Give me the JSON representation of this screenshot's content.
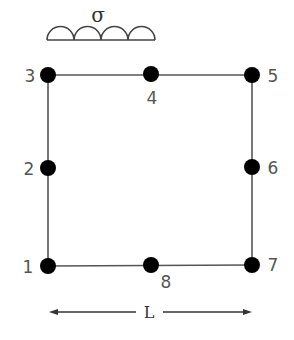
{
  "diagram": {
    "title": "",
    "load": {
      "symbol": "σ",
      "arcs": 4
    },
    "dimension": {
      "label": "L"
    },
    "nodes": [
      {
        "id": "1",
        "label": "1",
        "x": 48,
        "y": 266
      },
      {
        "id": "2",
        "label": "2",
        "x": 48,
        "y": 168
      },
      {
        "id": "3",
        "label": "3",
        "x": 48,
        "y": 75
      },
      {
        "id": "4",
        "label": "4",
        "x": 151,
        "y": 75
      },
      {
        "id": "5",
        "label": "5",
        "x": 252,
        "y": 75
      },
      {
        "id": "6",
        "label": "6",
        "x": 252,
        "y": 167
      },
      {
        "id": "7",
        "label": "7",
        "x": 252,
        "y": 265
      },
      {
        "id": "8",
        "label": "8",
        "x": 151,
        "y": 265
      }
    ],
    "colors": {
      "line": "#555555",
      "node": "#000000",
      "text": "#555555"
    }
  }
}
